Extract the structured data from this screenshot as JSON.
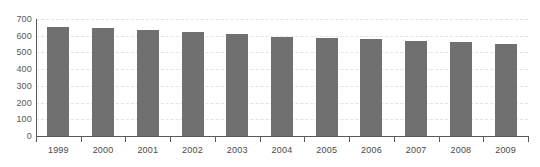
{
  "chart_data": {
    "type": "bar",
    "title": "",
    "xlabel": "",
    "ylabel": "",
    "categories": [
      "1999",
      "2000",
      "2001",
      "2002",
      "2003",
      "2004",
      "2005",
      "2006",
      "2007",
      "2008",
      "2009"
    ],
    "values": [
      655,
      645,
      633,
      622,
      608,
      595,
      587,
      578,
      568,
      562,
      553
    ],
    "ylim": [
      0,
      700
    ],
    "yticks": [
      0,
      100,
      200,
      300,
      400,
      500,
      600,
      700
    ],
    "ytick_labels": [
      "0",
      "100",
      "200",
      "300",
      "400",
      "500",
      "600",
      "700"
    ],
    "grid": true,
    "grid_axis": "y",
    "grid_style": "dashed",
    "legend": "none",
    "bar_color": "#707070",
    "grid_color": "#e2e2e6",
    "axis_color": "#5a5a5a",
    "tick_label_color": "#4a4a4a",
    "background": "#ffffff"
  }
}
